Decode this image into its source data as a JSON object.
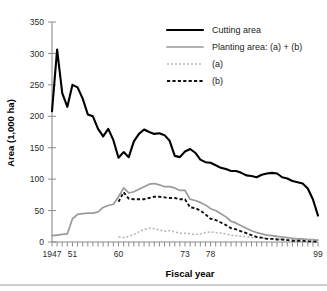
{
  "chart_data": {
    "type": "line",
    "title": "",
    "xlabel": "Fiscal year",
    "ylabel": "Area (1,000 ha)",
    "xlim": [
      1947,
      1999
    ],
    "ylim": [
      0,
      350
    ],
    "grid": false,
    "legend_position": "top-right",
    "ytick_labels": [
      "0",
      "50",
      "100",
      "150",
      "200",
      "250",
      "300",
      "350"
    ],
    "ytick_values": [
      0,
      50,
      100,
      150,
      200,
      250,
      300,
      350
    ],
    "xtick_labels": [
      "1947",
      "51",
      "60",
      "73",
      "78",
      "99"
    ],
    "xtick_values": [
      1947,
      1951,
      1960,
      1973,
      1978,
      1999
    ],
    "x": [
      1947,
      1948,
      1949,
      1950,
      1951,
      1952,
      1953,
      1954,
      1955,
      1956,
      1957,
      1958,
      1959,
      1960,
      1961,
      1962,
      1963,
      1964,
      1965,
      1966,
      1967,
      1968,
      1969,
      1970,
      1971,
      1972,
      1973,
      1974,
      1975,
      1976,
      1977,
      1978,
      1979,
      1980,
      1981,
      1982,
      1983,
      1984,
      1985,
      1986,
      1987,
      1988,
      1989,
      1990,
      1991,
      1992,
      1993,
      1994,
      1995,
      1996,
      1997,
      1998,
      1999
    ],
    "series": [
      {
        "name": "Cutting area",
        "color": "#000000",
        "style": "solid-thick",
        "values": [
          208,
          306,
          237,
          215,
          250,
          246,
          228,
          203,
          200,
          180,
          168,
          180,
          162,
          134,
          143,
          135,
          160,
          172,
          179,
          175,
          172,
          173,
          170,
          161,
          137,
          135,
          144,
          148,
          142,
          131,
          127,
          126,
          122,
          118,
          116,
          113,
          113,
          110,
          106,
          105,
          103,
          107,
          109,
          110,
          109,
          103,
          101,
          97,
          95,
          93,
          85,
          68,
          42
        ]
      },
      {
        "name": "Planting area: (a) + (b)",
        "color": "#9a9a9a",
        "style": "solid",
        "values": [
          10,
          11,
          12,
          13,
          37,
          44,
          45,
          46,
          46,
          48,
          55,
          58,
          60,
          72,
          86,
          78,
          80,
          84,
          88,
          92,
          93,
          91,
          88,
          88,
          86,
          82,
          82,
          68,
          66,
          63,
          59,
          53,
          50,
          45,
          40,
          33,
          30,
          26,
          22,
          18,
          15,
          13,
          11,
          10,
          9,
          8,
          7,
          6,
          5,
          5,
          4,
          4,
          3
        ]
      },
      {
        "name": "(a)",
        "color": "#b4b4b4",
        "style": "dotted",
        "values": [
          null,
          null,
          null,
          null,
          null,
          null,
          null,
          null,
          null,
          null,
          null,
          null,
          null,
          8,
          7,
          9,
          12,
          16,
          20,
          22,
          21,
          19,
          17,
          18,
          16,
          14,
          14,
          13,
          12,
          13,
          15,
          16,
          15,
          14,
          13,
          11,
          10,
          9,
          8,
          7,
          7,
          6,
          6,
          5,
          5,
          4,
          4,
          4,
          3,
          3,
          3,
          3,
          3
        ]
      },
      {
        "name": "(b)",
        "color": "#111111",
        "style": "dashed",
        "values": [
          null,
          null,
          null,
          null,
          null,
          null,
          null,
          null,
          null,
          null,
          null,
          null,
          null,
          64,
          79,
          69,
          68,
          68,
          68,
          70,
          72,
          72,
          71,
          70,
          70,
          68,
          68,
          55,
          54,
          50,
          44,
          37,
          35,
          31,
          27,
          22,
          20,
          17,
          14,
          11,
          8,
          7,
          5,
          5,
          4,
          4,
          3,
          2,
          2,
          2,
          1,
          1,
          0
        ]
      }
    ]
  }
}
